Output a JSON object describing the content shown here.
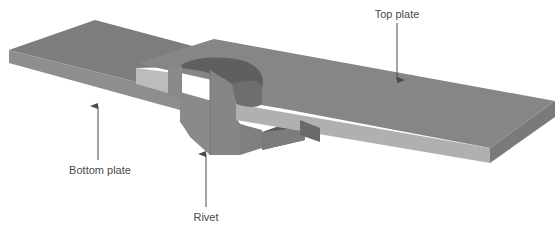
{
  "figure": {
    "colors": {
      "background": "#ffffff",
      "bottom_plate_top": "#7d7d7d",
      "bottom_plate_front": "#8e8e8e",
      "bottom_plate_cut": "#bcbcbc",
      "top_plate_top": "#868686",
      "top_plate_front": "#b0b0b0",
      "top_plate_side": "#7a7a7a",
      "rivet_face": "#8a8a8a",
      "rivet_face_right": "#858585",
      "rivet_head_hollow": "#5f5f5f",
      "rivet_shadow": "#5a5a5a",
      "arrow": "#4a4a4a",
      "text": "#4a4a4a"
    }
  },
  "labels": {
    "top_plate": "Top plate",
    "bottom_plate": "Bottom plate",
    "rivet": "Rivet"
  }
}
